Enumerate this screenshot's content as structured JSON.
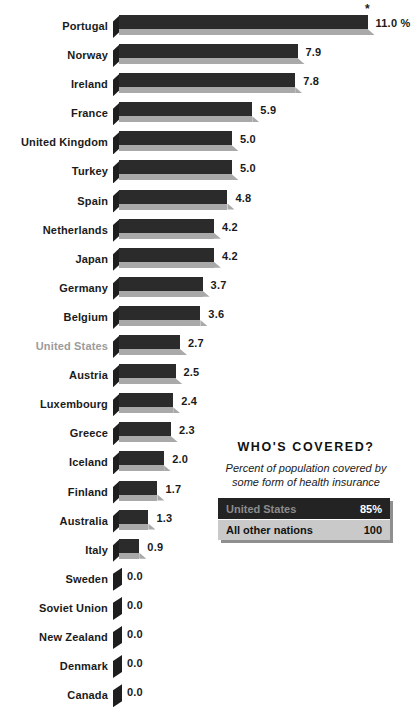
{
  "chart_data": {
    "type": "bar",
    "title": "",
    "subtitle": "",
    "xlabel": "",
    "ylabel": "",
    "orientation": "horizontal",
    "grid": false,
    "legend": "none",
    "xlim": [
      0,
      11.0
    ],
    "value_suffix_first": "%",
    "annotation": "*",
    "categories": [
      "Portugal",
      "Norway",
      "Ireland",
      "France",
      "United Kingdom",
      "Turkey",
      "Spain",
      "Netherlands",
      "Japan",
      "Germany",
      "Belgium",
      "United States",
      "Austria",
      "Luxembourg",
      "Greece",
      "Iceland",
      "Finland",
      "Australia",
      "Italy",
      "Sweden",
      "Soviet Union",
      "New Zealand",
      "Denmark",
      "Canada"
    ],
    "values": [
      11.0,
      7.9,
      7.8,
      5.9,
      5.0,
      5.0,
      4.8,
      4.2,
      4.2,
      3.7,
      3.6,
      2.7,
      2.5,
      2.4,
      2.3,
      2.0,
      1.7,
      1.3,
      0.9,
      0.0,
      0.0,
      0.0,
      0.0,
      0.0
    ],
    "value_labels": [
      "11.0 %",
      "7.9",
      "7.8",
      "5.9",
      "5.0",
      "5.0",
      "4.8",
      "4.2",
      "4.2",
      "3.7",
      "3.6",
      "2.7",
      "2.5",
      "2.4",
      "2.3",
      "2.0",
      "1.7",
      "1.3",
      "0.9",
      "0.0",
      "0.0",
      "0.0",
      "0.0",
      "0.0"
    ],
    "highlight_category": "United States",
    "colors": {
      "bar_top": "#2b2b2b",
      "bar_shadow": "#a9a9a9",
      "bar_cap": "#1e1e1e",
      "label": "#1a1a1a",
      "highlight_label": "#9b9b9b",
      "background": "#ffffff"
    }
  },
  "inset": {
    "title": "WHO'S COVERED?",
    "subtitle": "Percent of population covered by some form of health insurance",
    "rows": [
      {
        "label": "United States",
        "value": "85%",
        "style": "dark"
      },
      {
        "label": "All other nations",
        "value": "100",
        "style": "light"
      }
    ]
  }
}
